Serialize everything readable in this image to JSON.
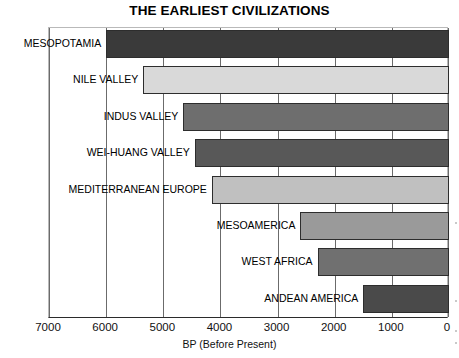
{
  "chart_data": {
    "type": "bar",
    "orientation": "horizontal",
    "title": "THE EARLIEST CIVILIZATIONS",
    "xlabel": "BP (Before Present)",
    "ylabel": "",
    "xlim": [
      7000,
      0
    ],
    "x_axis_reversed": true,
    "grid": "vertical",
    "legend": "none",
    "tick_labels": [
      "7000",
      "6000",
      "5000",
      "4000",
      "3000",
      "2000",
      "1000",
      "0"
    ],
    "tick_values": [
      7000,
      6000,
      5000,
      4000,
      3000,
      2000,
      1000,
      0
    ],
    "categories": [
      "MESOPOTAMIA",
      "NILE VALLEY",
      "INDUS VALLEY",
      "WEI-HUANG VALLEY",
      "MEDITERRANEAN EUROPE",
      "MESOAMERICA",
      "WEST AFRICA",
      "ANDEAN AMERICA"
    ],
    "bars": [
      {
        "label": "MESOPOTAMIA",
        "start_bp": 6000,
        "end_bp": 0,
        "color": "#3a3a3a"
      },
      {
        "label": "NILE VALLEY",
        "start_bp": 5350,
        "end_bp": 0,
        "color": "#d9d9d9"
      },
      {
        "label": "INDUS VALLEY",
        "start_bp": 4650,
        "end_bp": 0,
        "color": "#6e6e6e"
      },
      {
        "label": "WEI-HUANG VALLEY",
        "start_bp": 4450,
        "end_bp": 0,
        "color": "#585858"
      },
      {
        "label": "MEDITERRANEAN EUROPE",
        "start_bp": 4150,
        "end_bp": 0,
        "color": "#c0c0c0"
      },
      {
        "label": "MESOAMERICA",
        "start_bp": 2600,
        "end_bp": 0,
        "color": "#9a9a9a"
      },
      {
        "label": "WEST AFRICA",
        "start_bp": 2300,
        "end_bp": 0,
        "color": "#707070"
      },
      {
        "label": "ANDEAN AMERICA",
        "start_bp": 1500,
        "end_bp": 0,
        "color": "#4a4a4a"
      }
    ],
    "values": [
      6000,
      5350,
      4650,
      4450,
      4150,
      2600,
      2300,
      1500
    ],
    "units": "years Before Present"
  },
  "colors": {
    "background": "#ffffff",
    "text": "#000000",
    "gridline": "#6b6b6b",
    "axis": "#2b2b2b"
  }
}
